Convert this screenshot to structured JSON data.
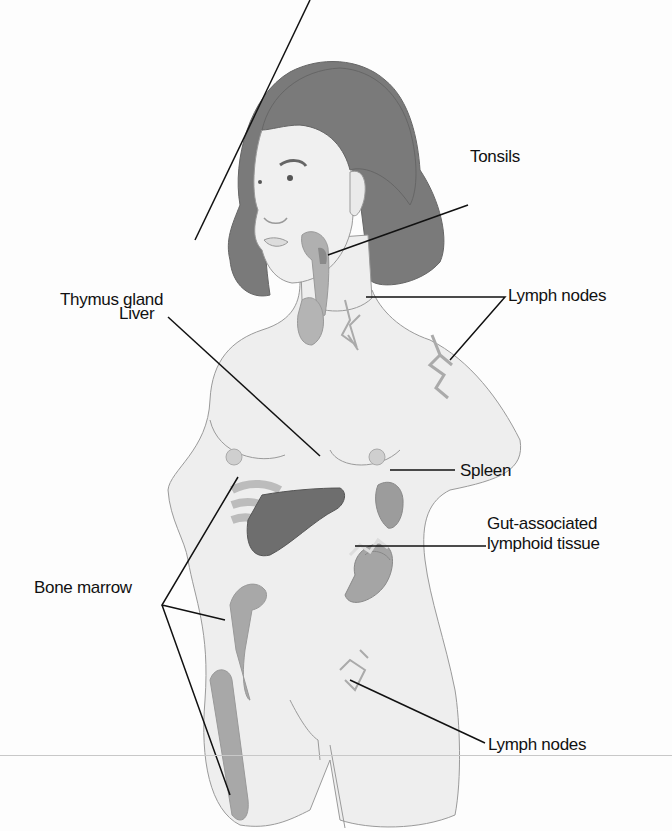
{
  "diagram": {
    "labels": {
      "tonsils": "Tonsils",
      "lymph_nodes_neck_axilla": "Lymph nodes",
      "thymus": "Thymus gland",
      "liver": "Liver",
      "spleen": "Spleen",
      "galt_line1": "Gut-associated",
      "galt_line2": "lymphoid tissue",
      "bone_marrow": "Bone marrow",
      "lymph_nodes_groin": "Lymph nodes"
    },
    "colors": {
      "skin": "#eeeeee",
      "outline": "#9a9a9a",
      "hair": "#7a7a7a",
      "organ_dark": "#6e6e6e",
      "organ_mid": "#9c9c9c",
      "organ_light": "#b4b4b4",
      "leader_line": "#111111"
    }
  }
}
